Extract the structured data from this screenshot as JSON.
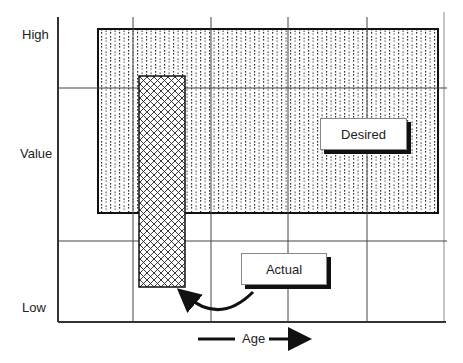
{
  "diagram": {
    "y_axis": {
      "high_label": "High",
      "mid_label": "Value",
      "low_label": "Low"
    },
    "x_axis": {
      "label": "Age"
    },
    "regions": [
      {
        "name": "Desired",
        "label": "Desired",
        "fill": "dotted"
      },
      {
        "name": "Actual",
        "label": "Actual",
        "fill": "crosshatch"
      }
    ],
    "desired_label": "Desired",
    "actual_label": "Actual",
    "colors": {
      "line": "#111111",
      "grid": "#444444",
      "background": "#ffffff"
    }
  }
}
